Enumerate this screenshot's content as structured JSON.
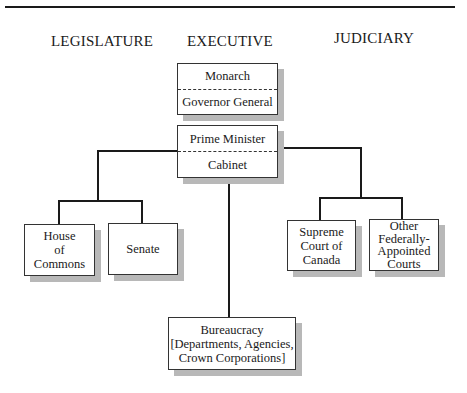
{
  "headings": {
    "legislature": "LEGISLATURE",
    "executive": "EXECUTIVE",
    "judiciary": "JUDICIARY"
  },
  "executive": {
    "head_of_state": {
      "top": "Monarch",
      "bottom": "Governor General"
    },
    "government": {
      "top": "Prime Minister",
      "bottom": "Cabinet"
    },
    "bureaucracy": {
      "line1": "Bureaucracy",
      "line2": "[Departments, Agencies,",
      "line3": "Crown Corporations]"
    }
  },
  "legislature": {
    "house": {
      "line1": "House",
      "line2": "of",
      "line3": "Commons"
    },
    "senate": {
      "label": "Senate"
    }
  },
  "judiciary": {
    "supreme": {
      "line1": "Supreme",
      "line2": "Court of",
      "line3": "Canada"
    },
    "other": {
      "line1": "Other",
      "line2": "Federally-",
      "line3": "Appointed",
      "line4": "Courts"
    }
  }
}
